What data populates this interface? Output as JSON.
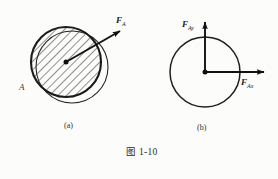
{
  "figure": {
    "caption": "图 1-10",
    "panels": [
      {
        "id": "a",
        "sub_caption": "(a)",
        "point_label": "A",
        "force_label": "F",
        "force_subscript": "A",
        "description": "hatched-disk-with-resultant-force"
      },
      {
        "id": "b",
        "sub_caption": "(b)",
        "force_y_label": "F",
        "force_y_subscript": "Ay",
        "force_x_label": "F",
        "force_x_subscript": "Ax",
        "description": "plain-disk-with-component-forces"
      }
    ]
  },
  "margin": {
    "clipped_column": [
      "",
      "",
      "",
      "",
      "",
      "",
      "",
      "",
      "",
      "",
      "",
      "",
      ""
    ]
  },
  "colors": {
    "ink": "#1a1a1a",
    "line": "#222222",
    "hatch": "#3c3c3c",
    "page": "#fcfcfb",
    "faint": "#8e8e8e"
  }
}
